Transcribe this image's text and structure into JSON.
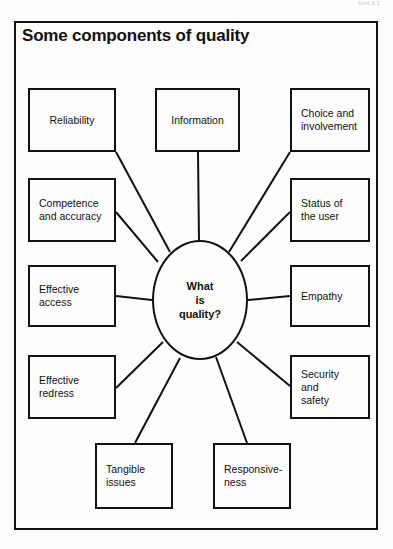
{
  "page": {
    "scan_mark": "Unit 3.1"
  },
  "figure": {
    "title": "Some components of quality",
    "center": {
      "label": "What\nis\nquality?",
      "shape": "oval"
    },
    "nodes": [
      {
        "id": "reliability",
        "label": "Reliability",
        "align": "center",
        "x": 28,
        "y": 88,
        "w": 88,
        "h": 64
      },
      {
        "id": "competence-accuracy",
        "label": "Competence\nand accuracy",
        "align": "left",
        "x": 28,
        "y": 178,
        "w": 88,
        "h": 64
      },
      {
        "id": "effective-access",
        "label": "Effective\naccess",
        "align": "left",
        "x": 28,
        "y": 265,
        "w": 88,
        "h": 62
      },
      {
        "id": "effective-redress",
        "label": "Effective\nredress",
        "align": "left",
        "x": 28,
        "y": 355,
        "w": 88,
        "h": 64
      },
      {
        "id": "tangible-issues",
        "label": "Tangible\nissues",
        "align": "left",
        "x": 95,
        "y": 443,
        "w": 78,
        "h": 66
      },
      {
        "id": "responsiveness",
        "label": "Responsive-\nness",
        "align": "left",
        "x": 213,
        "y": 443,
        "w": 78,
        "h": 66
      },
      {
        "id": "security-safety",
        "label": "Security\nand\nsafety",
        "align": "left",
        "x": 290,
        "y": 355,
        "w": 80,
        "h": 64
      },
      {
        "id": "empathy",
        "label": "Empathy",
        "align": "left",
        "x": 290,
        "y": 265,
        "w": 80,
        "h": 62
      },
      {
        "id": "status-of-the-user",
        "label": "Status of\nthe user",
        "align": "left",
        "x": 290,
        "y": 178,
        "w": 80,
        "h": 64
      },
      {
        "id": "choice-involvement",
        "label": "Choice and\ninvolvement",
        "align": "left",
        "x": 290,
        "y": 88,
        "w": 80,
        "h": 64
      },
      {
        "id": "information",
        "label": "Information",
        "align": "center",
        "x": 155,
        "y": 88,
        "w": 85,
        "h": 64
      }
    ],
    "connectors": [
      {
        "from": "reliability",
        "x1": 116,
        "y1": 152,
        "x2": 170,
        "y2": 252
      },
      {
        "from": "competence-accuracy",
        "x1": 116,
        "y1": 212,
        "x2": 158,
        "y2": 262
      },
      {
        "from": "effective-access",
        "x1": 116,
        "y1": 296,
        "x2": 152,
        "y2": 300
      },
      {
        "from": "effective-redress",
        "x1": 116,
        "y1": 388,
        "x2": 163,
        "y2": 342
      },
      {
        "from": "tangible-issues",
        "x1": 135,
        "y1": 443,
        "x2": 180,
        "y2": 358
      },
      {
        "from": "responsiveness",
        "x1": 247,
        "y1": 443,
        "x2": 216,
        "y2": 357
      },
      {
        "from": "security-safety",
        "x1": 290,
        "y1": 386,
        "x2": 237,
        "y2": 342
      },
      {
        "from": "empathy",
        "x1": 290,
        "y1": 296,
        "x2": 248,
        "y2": 300
      },
      {
        "from": "status-of-the-user",
        "x1": 290,
        "y1": 212,
        "x2": 241,
        "y2": 261
      },
      {
        "from": "choice-involvement",
        "x1": 290,
        "y1": 152,
        "x2": 229,
        "y2": 252
      },
      {
        "from": "information",
        "x1": 198,
        "y1": 152,
        "x2": 199,
        "y2": 241
      }
    ]
  }
}
